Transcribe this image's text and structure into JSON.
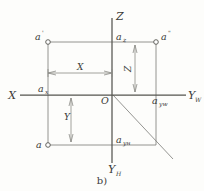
{
  "figure": {
    "caption": "b)",
    "axes": [
      {
        "name": "z-axis",
        "label": "Z",
        "sub": ""
      },
      {
        "name": "x-axis",
        "label": "X",
        "sub": ""
      },
      {
        "name": "yw-axis",
        "label": "Y",
        "sub": "W"
      },
      {
        "name": "yh-axis",
        "label": "Y",
        "sub": "H"
      }
    ],
    "points": [
      {
        "name": "point-a-prime",
        "label": "a",
        "sub": "",
        "prime": "'"
      },
      {
        "name": "point-az",
        "label": "a",
        "sub": "z",
        "prime": ""
      },
      {
        "name": "point-a-double-prime",
        "label": "a",
        "sub": "",
        "prime": "\""
      },
      {
        "name": "point-ax",
        "label": "a",
        "sub": "x",
        "prime": ""
      },
      {
        "name": "point-origin",
        "label": "O",
        "sub": "",
        "prime": ""
      },
      {
        "name": "point-ayw",
        "label": "a",
        "sub": "yw",
        "prime": ""
      },
      {
        "name": "point-a",
        "label": "a",
        "sub": "",
        "prime": ""
      },
      {
        "name": "point-ayh",
        "label": "a",
        "sub": "yн",
        "prime": ""
      }
    ],
    "dimensions": [
      {
        "name": "dimension-x",
        "label": "X"
      },
      {
        "name": "dimension-y",
        "label": "Y"
      },
      {
        "name": "dimension-z",
        "label": "Z"
      }
    ],
    "colors": {
      "line": "#6f6f6c",
      "axis": "#4a4a47",
      "text": "#3a3a38",
      "background": "#fdfdfb"
    }
  }
}
